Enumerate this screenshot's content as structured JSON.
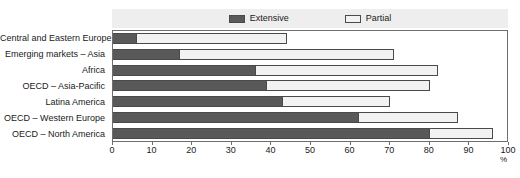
{
  "figure": {
    "title_clipped": "",
    "unit_label": "%"
  },
  "legend": {
    "position": "top-center",
    "entries": [
      {
        "label": "Extensive",
        "color": "#595959"
      },
      {
        "label": "Partial",
        "color": "#f2f2f2"
      }
    ]
  },
  "colors": {
    "extensive": "#595959",
    "partial": "#f2f2f2",
    "legend_band": "#eeeeee",
    "axis": "#6e6e6e",
    "text": "#1a1a1a"
  },
  "chart_data": {
    "type": "bar",
    "orientation": "horizontal",
    "stacked": true,
    "title": "",
    "xlabel": "%",
    "ylabel": "",
    "xlim": [
      0,
      100
    ],
    "xticks": [
      0,
      10,
      20,
      30,
      40,
      50,
      60,
      70,
      80,
      90,
      100
    ],
    "grid": false,
    "legend_position": "top-center",
    "categories": [
      "Central and Eastern Europe",
      "Emerging markets – Asia",
      "Africa",
      "OECD – Asia-Pacific",
      "Latina America",
      "OECD – Western Europe",
      "OECD – North America"
    ],
    "series": [
      {
        "name": "Extensive",
        "color": "#595959",
        "values": [
          6,
          17,
          36,
          39,
          43,
          62,
          80
        ]
      },
      {
        "name": "Partial",
        "color": "#f2f2f2",
        "values": [
          38,
          54,
          46,
          41,
          27,
          25,
          16
        ]
      }
    ],
    "totals": [
      44,
      71,
      82,
      80,
      70,
      87,
      96
    ]
  }
}
